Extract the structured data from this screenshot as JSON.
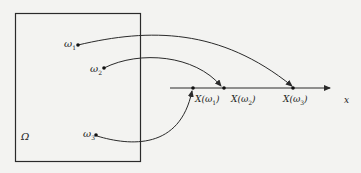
{
  "diagram": {
    "type": "mapping-diagram",
    "sample_space": {
      "label": "Ω",
      "box": {
        "x": 15,
        "y": 13,
        "w": 125,
        "h": 148
      }
    },
    "points": [
      {
        "id": "omega1",
        "symbol": "ω",
        "index": "1",
        "x": 78,
        "y": 45
      },
      {
        "id": "omega2",
        "symbol": "ω",
        "index": "2",
        "x": 104,
        "y": 68
      },
      {
        "id": "omega3",
        "symbol": "ω",
        "index": "3",
        "x": 96,
        "y": 135
      }
    ],
    "axis": {
      "label": "x",
      "y": 88,
      "x_start": 170,
      "x_end": 330
    },
    "images": [
      {
        "id": "X_omega1",
        "label": "X(ω",
        "index": "1",
        "close": ")",
        "x": 193
      },
      {
        "id": "X_omega2",
        "label": "X(ω",
        "index": "2",
        "close": ")",
        "x": 223
      },
      {
        "id": "X_omega3",
        "label": "X(ω",
        "index": "3",
        "close": ")",
        "x": 293
      }
    ],
    "mappings": [
      {
        "from": "omega1",
        "to": "X_omega3"
      },
      {
        "from": "omega2",
        "to": "X_omega2"
      },
      {
        "from": "omega3",
        "to": "X_omega1"
      }
    ],
    "colors": {
      "line": "#2a2a2a",
      "background": "#f3f3f1"
    }
  }
}
